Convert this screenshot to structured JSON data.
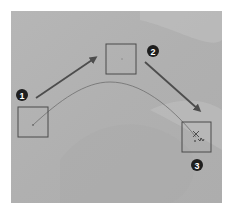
{
  "diagram": {
    "type": "motion-path",
    "frame": {
      "x": 11,
      "y": 11,
      "width": 211,
      "height": 192,
      "background": "#b3b3b3",
      "highlight": "#c4c4c4",
      "shadow": "#a6a6a6"
    },
    "colors": {
      "box_stroke": "#4a4a4a",
      "arrow": "#4d4d4d",
      "path": "#6e6e6e",
      "marker_fill": "#1e1e1e",
      "marker_text": "#ffffff"
    },
    "steps": [
      {
        "id": 1,
        "label": "1",
        "box": {
          "x": 18,
          "y": 107,
          "w": 30,
          "h": 30
        },
        "marker": {
          "cx": 22,
          "cy": 95
        }
      },
      {
        "id": 2,
        "label": "2",
        "box": {
          "x": 106,
          "y": 44,
          "w": 30,
          "h": 30
        },
        "marker": {
          "cx": 153,
          "cy": 51
        }
      },
      {
        "id": 3,
        "label": "3",
        "box": {
          "x": 182,
          "y": 122,
          "w": 29,
          "h": 30
        },
        "marker": {
          "cx": 197,
          "cy": 165
        }
      }
    ],
    "arrows": [
      {
        "from": "1",
        "to": "2"
      },
      {
        "from": "2",
        "to": "3"
      }
    ],
    "curve": {
      "description": "curved motion path from step 1 to step 3"
    },
    "end_marker": {
      "icon": "crosshair-cursor"
    }
  }
}
